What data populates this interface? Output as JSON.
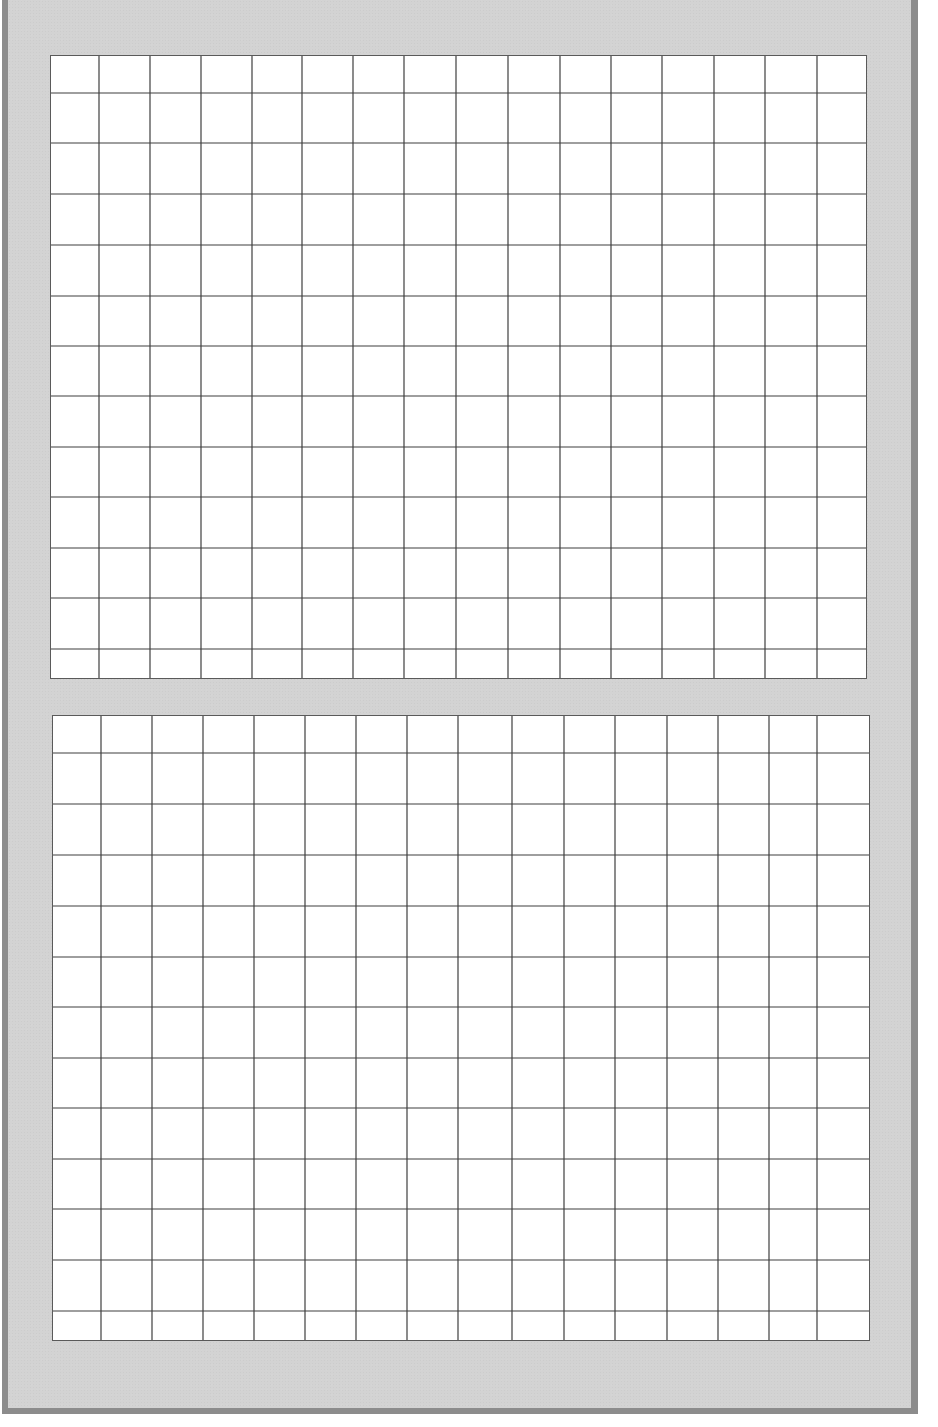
{
  "page": {
    "width": 938,
    "height": 1427,
    "background": "#ffffff"
  },
  "frame": {
    "fill_color": "#d3d3d3",
    "border_color": "#8c8c8c"
  },
  "grid_style": {
    "cell_fill": "#ffffff",
    "line_color": "#3e3e3e"
  },
  "panels": [
    {
      "name": "top-grid",
      "left": 50,
      "top": 55,
      "width": 817,
      "height": 624,
      "columns": 16,
      "rows": 13,
      "col_lines": [
        98,
        149,
        200,
        251,
        301,
        352,
        403,
        455,
        507,
        559,
        610,
        661,
        713,
        764,
        816
      ],
      "row_lines": [
        92,
        142,
        193,
        244,
        295,
        345,
        395,
        446,
        496,
        547,
        597,
        648
      ]
    },
    {
      "name": "bottom-grid",
      "left": 52,
      "top": 715,
      "width": 818,
      "height": 626,
      "columns": 16,
      "rows": 13,
      "col_lines": [
        100,
        151,
        202,
        253,
        304,
        355,
        406,
        457,
        511,
        563,
        614,
        666,
        717,
        768,
        816
      ],
      "row_lines": [
        752,
        803,
        854,
        905,
        956,
        1006,
        1057,
        1107,
        1158,
        1208,
        1259,
        1310
      ]
    }
  ]
}
